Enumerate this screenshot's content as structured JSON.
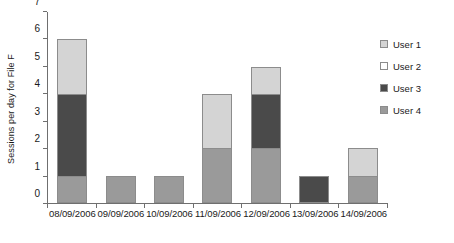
{
  "chart_data": {
    "type": "bar",
    "title": "",
    "subtitle": "",
    "stacked": true,
    "xlabel": "",
    "ylabel": "Sessions per day for File F",
    "ylim": [
      0,
      7
    ],
    "yticks": [
      0,
      1,
      2,
      3,
      4,
      5,
      6,
      7
    ],
    "ytick_labels": [
      "0",
      "1",
      "2",
      "3",
      "4",
      "5",
      "6",
      "7"
    ],
    "grid": false,
    "legend_position": "right",
    "categories": [
      "08/09/2006",
      "09/09/2006",
      "10/09/2006",
      "11/09/2006",
      "12/09/2006",
      "13/09/2006",
      "14/09/2006"
    ],
    "series": [
      {
        "name": "User 4",
        "color": "#9a9a9a",
        "values": [
          1,
          1,
          1,
          2,
          2,
          0,
          1
        ]
      },
      {
        "name": "User 3",
        "color": "#4a4a4a",
        "values": [
          3,
          0,
          0,
          0,
          2,
          1,
          0
        ]
      },
      {
        "name": "User 2",
        "color": "#ffffff",
        "values": [
          0,
          0,
          0,
          0,
          0,
          0,
          0
        ]
      },
      {
        "name": "User 1",
        "color": "#d4d4d4",
        "values": [
          2,
          0,
          0,
          2,
          1,
          0,
          1
        ]
      }
    ],
    "stack_order_bottom_to_top": [
      "User 4",
      "User 3",
      "User 2",
      "User 1"
    ],
    "totals": [
      6,
      1,
      1,
      4,
      5,
      1,
      2
    ],
    "legend": [
      {
        "label": "User 1",
        "color": "#d4d4d4"
      },
      {
        "label": "User 2",
        "color": "#ffffff"
      },
      {
        "label": "User 3",
        "color": "#4a4a4a"
      },
      {
        "label": "User 4",
        "color": "#9a9a9a"
      }
    ],
    "axis_color": "#6f6f6f",
    "bar_border_color": "#8c8c8c"
  }
}
